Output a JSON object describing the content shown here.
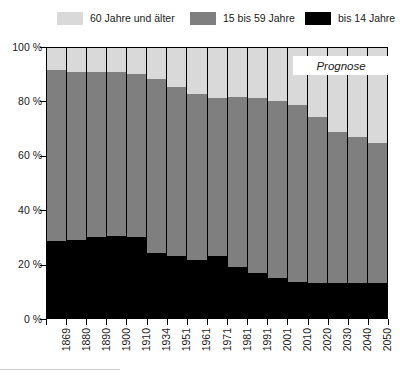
{
  "legend": {
    "items": [
      {
        "label": "60 Jahre und älter",
        "color": "#d9d9d9",
        "key": "age_60_plus"
      },
      {
        "label": "15 bis 59 Jahre",
        "color": "#7f7f7f",
        "key": "age_15_59"
      },
      {
        "label": "bis 14 Jahre",
        "color": "#000000",
        "key": "age_0_14"
      }
    ]
  },
  "annotation": {
    "prognose_label": "Prognose"
  },
  "axis": {
    "y_ticks": [
      "100 %",
      "80 %",
      "60 %",
      "40 %",
      "20 %",
      "0 %"
    ],
    "y_tick_values": [
      100,
      80,
      60,
      40,
      20,
      0
    ]
  },
  "chart_data": {
    "type": "bar",
    "stacked": true,
    "title": "",
    "subtitle": "",
    "xlabel": "",
    "ylabel": "",
    "ylim": [
      0,
      100
    ],
    "y_unit": "%",
    "grid": false,
    "legend_position": "top",
    "categories": [
      "1869",
      "1880",
      "1890",
      "1900",
      "1910",
      "1934",
      "1951",
      "1961",
      "1971",
      "1981",
      "1991",
      "2001",
      "2010",
      "2020",
      "2030",
      "2040",
      "2050"
    ],
    "series": [
      {
        "name": "bis 14 Jahre",
        "color": "#000000",
        "values": [
          28.5,
          29.0,
          30.0,
          30.5,
          30.0,
          24.0,
          23.0,
          21.5,
          23.0,
          19.0,
          16.5,
          15.0,
          13.5,
          13.0,
          13.0,
          13.0,
          13.0
        ]
      },
      {
        "name": "15 bis 59 Jahre",
        "color": "#7f7f7f",
        "values": [
          63.5,
          62.0,
          61.0,
          60.5,
          60.5,
          64.5,
          62.5,
          61.5,
          58.5,
          63.0,
          65.0,
          65.5,
          65.5,
          61.5,
          56.0,
          54.0,
          52.0
        ]
      },
      {
        "name": "60 Jahre und älter",
        "color": "#d9d9d9",
        "values": [
          8.0,
          9.0,
          9.0,
          9.0,
          9.5,
          11.5,
          14.5,
          17.0,
          18.5,
          18.0,
          18.5,
          19.5,
          21.0,
          25.5,
          31.0,
          33.0,
          35.0
        ]
      }
    ],
    "cumulative_tops": {
      "age_0_14": [
        28.5,
        29.0,
        30.0,
        30.5,
        30.0,
        24.0,
        23.0,
        21.5,
        23.0,
        19.0,
        16.5,
        15.0,
        13.5,
        13.0,
        13.0,
        13.0,
        13.0
      ],
      "age_15_59": [
        92.0,
        91.0,
        91.0,
        91.0,
        90.5,
        88.5,
        85.5,
        83.0,
        81.5,
        82.0,
        81.5,
        80.5,
        79.0,
        74.5,
        69.0,
        67.0,
        65.0
      ],
      "age_60_plus": [
        100,
        100,
        100,
        100,
        100,
        100,
        100,
        100,
        100,
        100,
        100,
        100,
        100,
        100,
        100,
        100,
        100
      ]
    },
    "forecast_from_category": "2020",
    "annotations": [
      {
        "text": "Prognose",
        "style": "italic",
        "region": "top-right"
      }
    ]
  }
}
